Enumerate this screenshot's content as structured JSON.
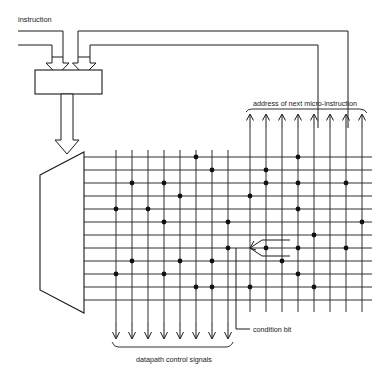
{
  "figure": {
    "labels": {
      "instruction": "instruction",
      "register": "register",
      "decoder": "decoder",
      "address_next": "address of next micro-instruction",
      "condition_bit": "condition bit",
      "datapath": "datapath control signals"
    },
    "colors": {
      "ink": "#1a1a1a",
      "paper": "#ffffff",
      "dot": "#111111"
    }
  },
  "chart_data": {
    "type": "diagram",
    "matrix": {
      "rows": 12,
      "row_y": [
        157,
        170,
        183,
        196,
        209,
        222,
        235,
        248,
        261,
        274,
        287,
        300
      ],
      "left_columns": 8,
      "right_columns": 8,
      "left_col_x": [
        116,
        132,
        148,
        164,
        180,
        196,
        212,
        228
      ],
      "right_col_x": [
        250,
        266,
        282,
        298,
        314,
        330,
        346,
        362
      ],
      "x_start": 106,
      "x_end": 372,
      "dots_left": [
        [
          0,
          5
        ],
        [
          1,
          6
        ],
        [
          2,
          1
        ],
        [
          2,
          3
        ],
        [
          3,
          4
        ],
        [
          4,
          0
        ],
        [
          4,
          2
        ],
        [
          5,
          3
        ],
        [
          5,
          7
        ],
        [
          7,
          7
        ],
        [
          8,
          1
        ],
        [
          8,
          4
        ],
        [
          8,
          6
        ],
        [
          9,
          0
        ],
        [
          9,
          3
        ],
        [
          10,
          5
        ],
        [
          10,
          6
        ]
      ],
      "dots_right": [
        [
          0,
          3
        ],
        [
          1,
          1
        ],
        [
          2,
          1
        ],
        [
          2,
          3
        ],
        [
          2,
          6
        ],
        [
          3,
          0
        ],
        [
          4,
          3
        ],
        [
          5,
          7
        ],
        [
          6,
          4
        ],
        [
          7,
          1
        ],
        [
          7,
          3
        ],
        [
          7,
          6
        ],
        [
          8,
          2
        ],
        [
          9,
          3
        ],
        [
          10,
          0
        ],
        [
          10,
          4
        ]
      ]
    },
    "datapath_arrows": 8,
    "address_arrows": 8,
    "condition_bit_node": {
      "row": 7,
      "col_group": "right",
      "col": 0
    }
  }
}
